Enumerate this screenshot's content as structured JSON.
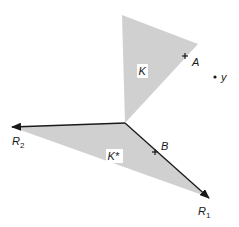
{
  "diagram": {
    "colors": {
      "fill": "#d0d0d0",
      "stroke": "#1a1a1a",
      "label_bg": "#ffffff"
    },
    "apex": {
      "x": 125,
      "y": 123
    },
    "cones": [
      {
        "id": "K",
        "label": "K",
        "vertices": [
          [
            125,
            123
          ],
          [
            122,
            15
          ],
          [
            198,
            44
          ]
        ]
      },
      {
        "id": "K_star",
        "label": "K*",
        "vertices": [
          [
            125,
            123
          ],
          [
            12,
            127
          ],
          [
            208,
            197
          ]
        ]
      }
    ],
    "rays": [
      {
        "id": "R1",
        "label": "R",
        "subscript": "1",
        "from": [
          125,
          123
        ],
        "to": [
          209,
          198
        ]
      },
      {
        "id": "R2",
        "label": "R",
        "subscript": "2",
        "from": [
          125,
          123
        ],
        "to": [
          11,
          127
        ]
      }
    ],
    "points": [
      {
        "id": "A",
        "label": "A",
        "x": 185,
        "y": 56,
        "marker": "cross"
      },
      {
        "id": "B",
        "label": "B",
        "x": 155,
        "y": 152,
        "marker": "cross"
      },
      {
        "id": "y",
        "label": "y",
        "x": 215,
        "y": 77,
        "marker": "dot"
      }
    ],
    "labels": {
      "K": "K",
      "K_star": "K*",
      "A": "A",
      "B": "B",
      "y": "y",
      "R1": "R",
      "R1_sub": "1",
      "R2": "R",
      "R2_sub": "2"
    }
  }
}
